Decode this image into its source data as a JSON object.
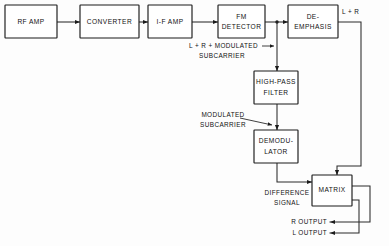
{
  "diagram": {
    "ink_color": "#1b1b1b",
    "background_color": "#fdfdfd",
    "blocks": [
      {
        "id": "rf-amp",
        "lines": [
          "RF AMP"
        ]
      },
      {
        "id": "converter",
        "lines": [
          "CONVERTER"
        ]
      },
      {
        "id": "if-amp",
        "lines": [
          "I-F AMP"
        ]
      },
      {
        "id": "fm-detector",
        "lines": [
          "FM",
          "DETECTOR"
        ]
      },
      {
        "id": "de-emphasis",
        "lines": [
          "DE-",
          "EMPHASIS"
        ]
      },
      {
        "id": "high-pass-filter",
        "lines": [
          "HIGH-PASS",
          "FILTER"
        ]
      },
      {
        "id": "demodulator",
        "lines": [
          "DEMODU-",
          "LATOR"
        ]
      },
      {
        "id": "matrix",
        "lines": [
          "MATRIX"
        ]
      }
    ],
    "signal_labels": [
      {
        "id": "l-plus-r",
        "lines": [
          "L + R"
        ]
      },
      {
        "id": "l-plus-r-plus-modulated",
        "lines": [
          "L + R + MODULATED",
          "SUBCARRIER"
        ]
      },
      {
        "id": "modulated-subcarrier",
        "lines": [
          "MODULATED",
          "SUBCARRIER"
        ]
      },
      {
        "id": "difference-signal",
        "lines": [
          "DIFFERENCE",
          "SIGNAL"
        ]
      },
      {
        "id": "r-output",
        "lines": [
          "R OUTPUT"
        ]
      },
      {
        "id": "l-output",
        "lines": [
          "L OUTPUT"
        ]
      }
    ]
  }
}
